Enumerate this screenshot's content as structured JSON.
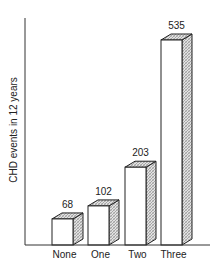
{
  "chart_data": {
    "type": "bar",
    "title": "",
    "xlabel": "",
    "ylabel": "CHD events in 12 years",
    "categories": [
      "None",
      "One",
      "Two",
      "Three"
    ],
    "values": [
      68,
      102,
      203,
      535
    ],
    "data_labels": [
      "68",
      "102",
      "203",
      "535"
    ],
    "ylim": [
      0,
      600
    ],
    "grid": false,
    "legend": null,
    "style": "3d-bars-with-hatched-side"
  },
  "colors": {
    "axis": "#333333",
    "bar_front": "#ffffff",
    "bar_side_hatch": "#bdbdbd",
    "bar_outline": "#222222",
    "text": "#222222"
  }
}
